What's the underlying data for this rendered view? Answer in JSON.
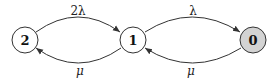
{
  "diagram": {
    "type": "state-transition",
    "nodes": [
      {
        "id": "2",
        "label": "2",
        "fill": "#ffffff"
      },
      {
        "id": "1",
        "label": "1",
        "fill": "#ffffff"
      },
      {
        "id": "0",
        "label": "0",
        "fill": "#d3d3d3"
      }
    ],
    "edges": [
      {
        "from": "2",
        "to": "1",
        "label": "2λ",
        "position": "top"
      },
      {
        "from": "1",
        "to": "0",
        "label": "λ",
        "position": "top"
      },
      {
        "from": "1",
        "to": "2",
        "label": "μ",
        "position": "bottom"
      },
      {
        "from": "0",
        "to": "1",
        "label": "μ",
        "position": "bottom"
      }
    ]
  }
}
